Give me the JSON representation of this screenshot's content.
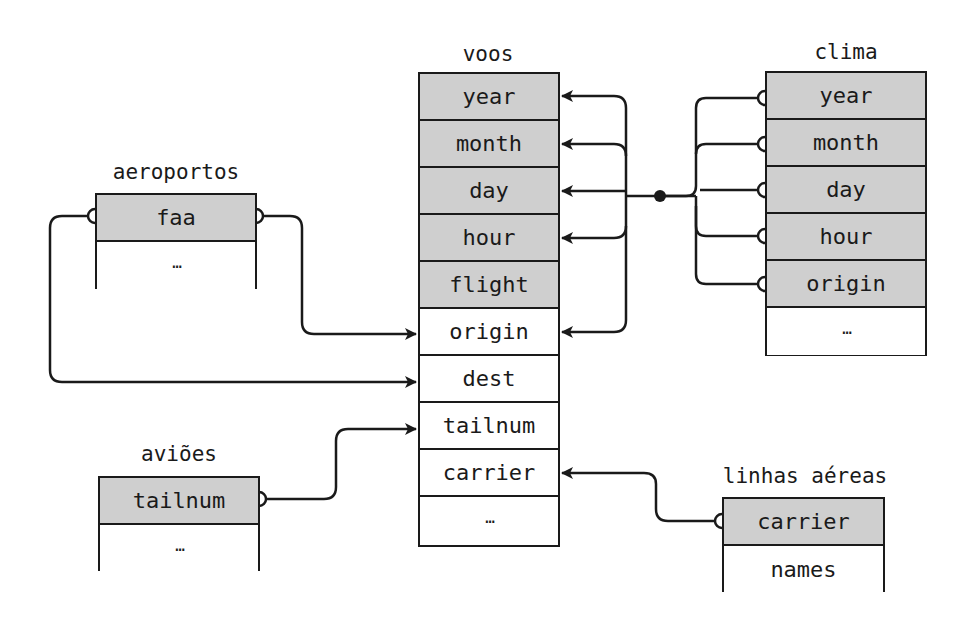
{
  "tables": {
    "voos": {
      "title": "voos",
      "rows": [
        {
          "label": "year",
          "key": true
        },
        {
          "label": "month",
          "key": true
        },
        {
          "label": "day",
          "key": true
        },
        {
          "label": "hour",
          "key": true
        },
        {
          "label": "flight",
          "key": true
        },
        {
          "label": "origin",
          "key": false
        },
        {
          "label": "dest",
          "key": false
        },
        {
          "label": "tailnum",
          "key": false
        },
        {
          "label": "carrier",
          "key": false
        },
        {
          "label": "…",
          "key": false
        }
      ]
    },
    "clima": {
      "title": "clima",
      "rows": [
        {
          "label": "year",
          "key": true
        },
        {
          "label": "month",
          "key": true
        },
        {
          "label": "day",
          "key": true
        },
        {
          "label": "hour",
          "key": true
        },
        {
          "label": "origin",
          "key": true
        },
        {
          "label": "…",
          "key": false
        }
      ]
    },
    "aeroportos": {
      "title": "aeroportos",
      "rows": [
        {
          "label": "faa",
          "key": true
        },
        {
          "label": "…",
          "key": false
        }
      ]
    },
    "avioes": {
      "title": "aviões",
      "rows": [
        {
          "label": "tailnum",
          "key": true
        },
        {
          "label": "…",
          "key": false
        }
      ]
    },
    "linhas_aereas": {
      "title": "linhas aéreas",
      "rows": [
        {
          "label": "carrier",
          "key": true
        },
        {
          "label": "names",
          "key": false
        }
      ]
    }
  },
  "relations": [
    {
      "from": "aeroportos.faa",
      "to": "voos.origin"
    },
    {
      "from": "aeroportos.faa",
      "to": "voos.dest"
    },
    {
      "from": "avioes.tailnum",
      "to": "voos.tailnum"
    },
    {
      "from": "linhas_aereas.carrier",
      "to": "voos.carrier"
    },
    {
      "from": "clima.year",
      "to": "voos.year"
    },
    {
      "from": "clima.month",
      "to": "voos.month"
    },
    {
      "from": "clima.day",
      "to": "voos.day"
    },
    {
      "from": "clima.hour",
      "to": "voos.hour"
    },
    {
      "from": "clima.origin",
      "to": "voos.origin"
    }
  ],
  "colors": {
    "key_fill": "#cfcfcf",
    "line": "#1a1a1a",
    "background": "#ffffff"
  }
}
